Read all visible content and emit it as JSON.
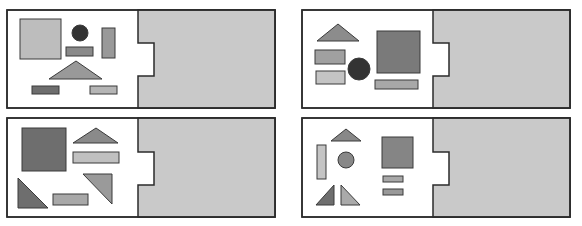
{
  "colors": {
    "background": "#ffffff",
    "border": "#2b2b2b",
    "tray_fill": "#c9c9c9",
    "dark": "#333333",
    "dark_gray": "#6e6e6e",
    "mid_gray": "#8c8c8c",
    "light_gray": "#b8b8b8",
    "pale_gray": "#c6c6c6"
  },
  "panels": [
    {
      "id": "panel-top-left",
      "frame": {
        "x": 7,
        "y": 10,
        "w": 268,
        "h": 98
      },
      "divider_x": 138,
      "notch": {
        "x2": 154,
        "y1": 43,
        "y2": 76
      },
      "shapes": [
        {
          "kind": "rect",
          "name": "large-square",
          "x": 20,
          "y": 19,
          "w": 41,
          "h": 40,
          "fill": "#bdbdbd"
        },
        {
          "kind": "circle",
          "name": "dark-circle",
          "cx": 80,
          "cy": 33,
          "r": 8,
          "fill": "#333333"
        },
        {
          "kind": "rect",
          "name": "small-bar",
          "x": 66,
          "y": 47,
          "w": 27,
          "h": 9,
          "fill": "#8a8a8a"
        },
        {
          "kind": "rect",
          "name": "tall-bar",
          "x": 102,
          "y": 28,
          "w": 13,
          "h": 30,
          "fill": "#999999"
        },
        {
          "kind": "poly",
          "name": "wide-triangle",
          "points": "76,61 102,79 49,79",
          "fill": "#999999"
        },
        {
          "kind": "rect",
          "name": "bottom-left-bar",
          "x": 32,
          "y": 86,
          "w": 27,
          "h": 8,
          "fill": "#6e6e6e"
        },
        {
          "kind": "rect",
          "name": "bottom-right-bar",
          "x": 90,
          "y": 86,
          "w": 27,
          "h": 8,
          "fill": "#b5b5b5"
        }
      ]
    },
    {
      "id": "panel-top-right",
      "frame": {
        "x": 302,
        "y": 10,
        "w": 268,
        "h": 98
      },
      "divider_x": 433,
      "notch": {
        "x2": 449,
        "y1": 43,
        "y2": 76
      },
      "shapes": [
        {
          "kind": "poly",
          "name": "top-triangle",
          "points": "338,24 359,41 317,41",
          "fill": "#8c8c8c"
        },
        {
          "kind": "rect",
          "name": "upper-bar",
          "x": 315,
          "y": 50,
          "w": 30,
          "h": 14,
          "fill": "#a0a0a0"
        },
        {
          "kind": "rect",
          "name": "lower-bar",
          "x": 316,
          "y": 71,
          "w": 29,
          "h": 13,
          "fill": "#c4c4c4"
        },
        {
          "kind": "circle",
          "name": "dark-circle",
          "cx": 359,
          "cy": 69,
          "r": 11,
          "fill": "#333333"
        },
        {
          "kind": "rect",
          "name": "large-square",
          "x": 377,
          "y": 31,
          "w": 43,
          "h": 42,
          "fill": "#7a7a7a"
        },
        {
          "kind": "rect",
          "name": "wide-bar",
          "x": 375,
          "y": 80,
          "w": 43,
          "h": 9,
          "fill": "#a8a8a8"
        }
      ]
    },
    {
      "id": "panel-bottom-left",
      "frame": {
        "x": 7,
        "y": 118,
        "w": 268,
        "h": 99
      },
      "divider_x": 138,
      "notch": {
        "x2": 154,
        "y1": 152,
        "y2": 185
      },
      "shapes": [
        {
          "kind": "rect",
          "name": "large-square",
          "x": 22,
          "y": 128,
          "w": 44,
          "h": 43,
          "fill": "#6e6e6e"
        },
        {
          "kind": "poly",
          "name": "top-triangle",
          "points": "96,128 118,143 73,143",
          "fill": "#8a8a8a"
        },
        {
          "kind": "rect",
          "name": "wide-bar",
          "x": 73,
          "y": 152,
          "w": 46,
          "h": 11,
          "fill": "#c0c0c0"
        },
        {
          "kind": "poly",
          "name": "right-triangle-down",
          "points": "83,174 112,174 112,204",
          "fill": "#9a9a9a"
        },
        {
          "kind": "poly",
          "name": "right-triangle-left",
          "points": "18,178 48,208 18,208",
          "fill": "#6e6e6e"
        },
        {
          "kind": "rect",
          "name": "bottom-bar",
          "x": 53,
          "y": 194,
          "w": 35,
          "h": 11,
          "fill": "#a8a8a8"
        }
      ]
    },
    {
      "id": "panel-bottom-right",
      "frame": {
        "x": 302,
        "y": 118,
        "w": 268,
        "h": 99
      },
      "divider_x": 433,
      "notch": {
        "x2": 449,
        "y1": 152,
        "y2": 185
      },
      "shapes": [
        {
          "kind": "poly",
          "name": "top-triangle",
          "points": "346,129 361,141 331,141",
          "fill": "#888888"
        },
        {
          "kind": "rect",
          "name": "tall-bar",
          "x": 317,
          "y": 145,
          "w": 9,
          "h": 34,
          "fill": "#c4c4c4"
        },
        {
          "kind": "circle",
          "name": "gray-circle",
          "cx": 346,
          "cy": 160,
          "r": 8,
          "fill": "#888888"
        },
        {
          "kind": "rect",
          "name": "large-square",
          "x": 382,
          "y": 137,
          "w": 31,
          "h": 31,
          "fill": "#858585"
        },
        {
          "kind": "rect",
          "name": "upper-small-bar",
          "x": 383,
          "y": 176,
          "w": 20,
          "h": 6,
          "fill": "#a8a8a8"
        },
        {
          "kind": "rect",
          "name": "lower-small-bar",
          "x": 383,
          "y": 189,
          "w": 20,
          "h": 6,
          "fill": "#999999"
        },
        {
          "kind": "poly",
          "name": "left-triangle",
          "points": "334,185 334,205 316,205",
          "fill": "#6e6e6e"
        },
        {
          "kind": "poly",
          "name": "right-triangle",
          "points": "341,185 360,205 341,205",
          "fill": "#aaaaaa"
        }
      ]
    }
  ]
}
